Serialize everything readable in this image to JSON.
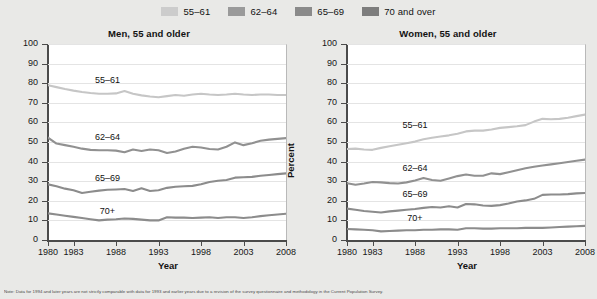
{
  "legend": {
    "items": [
      {
        "label": "55–61",
        "color": "#cccccc"
      },
      {
        "label": "62–64",
        "color": "#9a9a9a"
      },
      {
        "label": "65–69",
        "color": "#8a8a8a"
      },
      {
        "label": "70 and over",
        "color": "#7d7d7d"
      }
    ]
  },
  "note": "Note: Data for 1994 and later years are not strictly comparable with data for 1993 and earlier years due to a revision of the survey questionnaire and methodology in the Current Population Survey.",
  "chart_data": [
    {
      "type": "line",
      "title": "Men, 55 and older",
      "xlabel": "Year",
      "ylabel": "Percent",
      "ylim": [
        0,
        100
      ],
      "ytickstep": 10,
      "yticks": [
        0,
        10,
        20,
        30,
        40,
        50,
        60,
        70,
        80,
        90,
        100
      ],
      "xlim": [
        1980,
        2008
      ],
      "xticks": [
        1980,
        1983,
        1988,
        1993,
        1998,
        2003,
        2008
      ],
      "xticklabels": [
        "1980",
        "1983",
        "1988",
        "1993",
        "1998",
        "2003",
        "2008"
      ],
      "grid": true,
      "legend_position": "top-center-shared",
      "x": [
        1980,
        1981,
        1982,
        1983,
        1984,
        1985,
        1986,
        1987,
        1988,
        1989,
        1990,
        1991,
        1992,
        1993,
        1994,
        1995,
        1996,
        1997,
        1998,
        1999,
        2000,
        2001,
        2002,
        2003,
        2004,
        2005,
        2006,
        2007,
        2008
      ],
      "series": [
        {
          "name": "55–61",
          "color": "#c6c6c6",
          "label_x": 1987,
          "label_y": 81,
          "values": [
            79.0,
            78.0,
            77.0,
            76.2,
            75.5,
            75.0,
            74.6,
            74.6,
            74.8,
            76.0,
            74.6,
            73.8,
            73.2,
            72.8,
            73.4,
            74.0,
            73.6,
            74.2,
            74.6,
            74.2,
            74.0,
            74.2,
            74.6,
            74.2,
            74.0,
            74.2,
            74.2,
            74.0,
            74.0
          ]
        },
        {
          "name": "62–64",
          "color": "#919191",
          "label_x": 1987,
          "label_y": 52,
          "values": [
            52.2,
            49.2,
            48.4,
            47.6,
            46.6,
            46.0,
            45.8,
            45.8,
            45.6,
            44.8,
            46.2,
            45.4,
            46.2,
            45.8,
            44.4,
            45.2,
            46.6,
            47.6,
            47.2,
            46.4,
            46.2,
            47.6,
            49.8,
            48.4,
            49.4,
            50.6,
            51.2,
            51.6,
            52.0
          ]
        },
        {
          "name": "65–69",
          "color": "#8c8c8c",
          "label_x": 1987,
          "label_y": 31,
          "values": [
            28.4,
            27.4,
            26.2,
            25.4,
            24.0,
            24.6,
            25.2,
            25.6,
            25.8,
            26.0,
            25.0,
            26.4,
            25.0,
            25.4,
            26.6,
            27.2,
            27.4,
            27.6,
            28.4,
            29.6,
            30.2,
            30.6,
            31.8,
            32.0,
            32.2,
            32.8,
            33.2,
            33.6,
            34.0
          ]
        },
        {
          "name": "70+",
          "color": "#8c8c8c",
          "label_x": 1987,
          "label_y": 14.5,
          "values": [
            13.6,
            13.0,
            12.4,
            11.8,
            11.2,
            10.6,
            10.0,
            10.4,
            10.6,
            11.0,
            10.8,
            10.4,
            10.0,
            10.0,
            11.6,
            11.4,
            11.4,
            11.2,
            11.4,
            11.6,
            11.2,
            11.6,
            11.6,
            11.2,
            11.6,
            12.2,
            12.6,
            13.0,
            13.4
          ]
        }
      ]
    },
    {
      "type": "line",
      "title": "Women, 55 and older",
      "xlabel": "Year",
      "ylabel": "Percent",
      "ylim": [
        0,
        100
      ],
      "ytickstep": 10,
      "yticks": [
        0,
        10,
        20,
        30,
        40,
        50,
        60,
        70,
        80,
        90,
        100
      ],
      "xlim": [
        1980,
        2008
      ],
      "xticks": [
        1980,
        1983,
        1988,
        1993,
        1998,
        2003,
        2008
      ],
      "xticklabels": [
        "1980",
        "1983",
        "1988",
        "1993",
        "1998",
        "2003",
        "2008"
      ],
      "grid": true,
      "legend_position": "top-center-shared",
      "x": [
        1980,
        1981,
        1982,
        1983,
        1984,
        1985,
        1986,
        1987,
        1988,
        1989,
        1990,
        1991,
        1992,
        1993,
        1994,
        1995,
        1996,
        1997,
        1998,
        1999,
        2000,
        2001,
        2002,
        2003,
        2004,
        2005,
        2006,
        2007,
        2008
      ],
      "series": [
        {
          "name": "55–61",
          "color": "#c6c6c6",
          "label_x": 1988,
          "label_y": 58,
          "values": [
            46.4,
            46.6,
            46.2,
            46.0,
            47.0,
            47.8,
            48.6,
            49.4,
            50.2,
            51.4,
            52.2,
            52.8,
            53.4,
            54.2,
            55.4,
            55.8,
            55.8,
            56.4,
            57.2,
            57.6,
            58.0,
            58.6,
            60.4,
            61.8,
            61.6,
            61.8,
            62.4,
            63.2,
            64.0
          ]
        },
        {
          "name": "62–64",
          "color": "#919191",
          "label_x": 1988,
          "label_y": 36,
          "values": [
            29.0,
            28.2,
            28.8,
            29.6,
            29.4,
            29.0,
            28.8,
            29.4,
            30.4,
            31.6,
            30.6,
            30.2,
            31.4,
            32.6,
            33.4,
            32.8,
            32.8,
            34.0,
            33.6,
            34.6,
            35.6,
            36.6,
            37.4,
            38.0,
            38.6,
            39.2,
            39.8,
            40.4,
            41.0
          ]
        },
        {
          "name": "65–69",
          "color": "#8c8c8c",
          "label_x": 1988,
          "label_y": 23,
          "values": [
            16.0,
            15.4,
            14.8,
            14.4,
            14.0,
            14.6,
            15.0,
            15.4,
            15.8,
            16.4,
            16.8,
            16.6,
            17.2,
            16.6,
            18.4,
            18.2,
            17.6,
            17.4,
            17.8,
            18.6,
            19.6,
            20.2,
            21.0,
            23.0,
            23.2,
            23.2,
            23.4,
            23.8,
            24.0
          ]
        },
        {
          "name": "70+",
          "color": "#8c8c8c",
          "label_x": 1988,
          "label_y": 10.5,
          "values": [
            5.6,
            5.4,
            5.2,
            5.0,
            4.4,
            4.6,
            4.8,
            5.0,
            5.0,
            5.2,
            5.2,
            5.4,
            5.4,
            5.2,
            6.0,
            6.0,
            5.8,
            5.8,
            6.0,
            6.0,
            6.0,
            6.2,
            6.2,
            6.2,
            6.4,
            6.6,
            6.8,
            7.0,
            7.2
          ]
        }
      ]
    }
  ]
}
